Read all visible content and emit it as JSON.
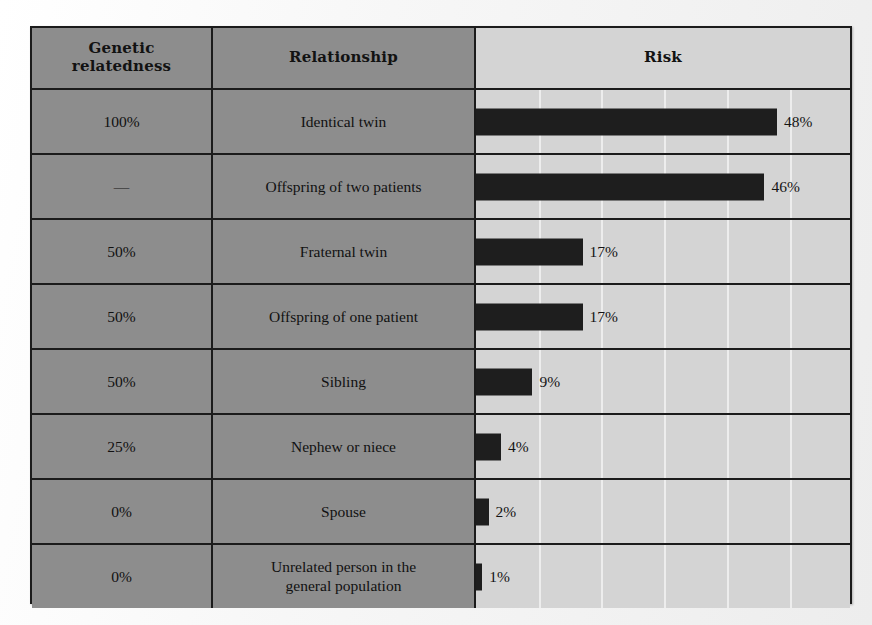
{
  "table": {
    "columns": [
      {
        "key": "relatedness",
        "label": "Genetic\nrelatedness"
      },
      {
        "key": "relationship",
        "label": "Relationship"
      },
      {
        "key": "risk",
        "label": "Risk"
      }
    ],
    "header": {
      "relatedness_line1": "Genetic",
      "relatedness_line2": "relatedness",
      "relationship": "Relationship",
      "risk": "Risk"
    },
    "rows": [
      {
        "relatedness": "100%",
        "relationship": "Identical twin",
        "relationship_line2": "",
        "risk_label": "48%",
        "risk_value": 48
      },
      {
        "relatedness": "—",
        "relationship": "Offspring of two patients",
        "relationship_line2": "",
        "risk_label": "46%",
        "risk_value": 46
      },
      {
        "relatedness": "50%",
        "relationship": "Fraternal twin",
        "relationship_line2": "",
        "risk_label": "17%",
        "risk_value": 17
      },
      {
        "relatedness": "50%",
        "relationship": "Offspring of one patient",
        "relationship_line2": "",
        "risk_label": "17%",
        "risk_value": 17
      },
      {
        "relatedness": "50%",
        "relationship": "Sibling",
        "relationship_line2": "",
        "risk_label": "9%",
        "risk_value": 9
      },
      {
        "relatedness": "25%",
        "relationship": "Nephew or niece",
        "relationship_line2": "",
        "risk_label": "4%",
        "risk_value": 4
      },
      {
        "relatedness": "0%",
        "relationship": "Spouse",
        "relationship_line2": "",
        "risk_label": "2%",
        "risk_value": 2
      },
      {
        "relatedness": "0%",
        "relationship": "Unrelated person in the",
        "relationship_line2": "general population",
        "risk_label": "1%",
        "risk_value": 1
      }
    ]
  },
  "colors": {
    "label_column_bg": "#8d8d8d",
    "risk_column_bg": "#d4d4d4",
    "bar_fill": "#1e1e1e",
    "border": "#1b1b1b",
    "gridline": "#eeeeee",
    "page_bg": "#fbfbfb"
  },
  "chart_data": {
    "type": "bar",
    "title": "Risk",
    "orientation": "horizontal",
    "xlabel": "Risk",
    "ylabel": "Relationship",
    "categories": [
      "Identical twin",
      "Offspring of two patients",
      "Fraternal twin",
      "Offspring of one patient",
      "Sibling",
      "Nephew or niece",
      "Spouse",
      "Unrelated person in the general population"
    ],
    "values": [
      48,
      46,
      17,
      17,
      9,
      4,
      2,
      1
    ],
    "data_labels": [
      "48%",
      "46%",
      "17%",
      "17%",
      "9%",
      "4%",
      "2%",
      "1%"
    ],
    "genetic_relatedness": [
      "100%",
      "—",
      "50%",
      "50%",
      "50%",
      "25%",
      "0%",
      "0%"
    ],
    "units": "percent",
    "xlim": [
      0,
      60
    ],
    "grid": true,
    "gridline_interval": 10,
    "legend": "none",
    "px_per_percent": 6.27,
    "bar_origin_px": 0
  }
}
